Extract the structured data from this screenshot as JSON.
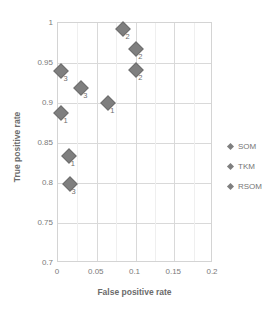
{
  "chart_data": {
    "type": "scatter",
    "title": "",
    "xlabel": "False positive rate",
    "ylabel": "True positive rate",
    "xlim": [
      0,
      0.2
    ],
    "ylim": [
      0.7,
      1
    ],
    "xticks": [
      "0",
      "0.05",
      "0.1",
      "0.15",
      "0.2"
    ],
    "xtick_values": [
      0,
      0.05,
      0.1,
      0.15,
      0.2
    ],
    "yticks": [
      "0.7",
      "0.75",
      "0.8",
      "0.85",
      "0.9",
      "0.95",
      "1"
    ],
    "ytick_values": [
      0.7,
      0.75,
      0.8,
      0.85,
      0.9,
      0.95,
      1
    ],
    "grid": true,
    "legend_position": "right",
    "legend": [
      "SOM",
      "TKM",
      "RSOM"
    ],
    "series": [
      {
        "name": "SOM",
        "points": [
          {
            "x": 0.0045,
            "y": 0.888,
            "label": "1"
          },
          {
            "x": 0.0845,
            "y": 0.993,
            "label": "2"
          },
          {
            "x": 0.0045,
            "y": 0.94,
            "label": "3"
          }
        ]
      },
      {
        "name": "TKM",
        "points": [
          {
            "x": 0.014,
            "y": 0.834,
            "label": "1"
          },
          {
            "x": 0.101,
            "y": 0.967,
            "label": "2"
          },
          {
            "x": 0.015,
            "y": 0.799,
            "label": "3"
          }
        ]
      },
      {
        "name": "RSOM",
        "points": [
          {
            "x": 0.065,
            "y": 0.9,
            "label": "1"
          },
          {
            "x": 0.101,
            "y": 0.941,
            "label": "2"
          },
          {
            "x": 0.03,
            "y": 0.919,
            "label": "3"
          }
        ]
      }
    ],
    "colors": {
      "marker": "#7f7f7f",
      "grid": "#d9d9d9",
      "frame": "#d4d4d4",
      "text": "#6b6b6b",
      "background": "#ffffff"
    }
  }
}
